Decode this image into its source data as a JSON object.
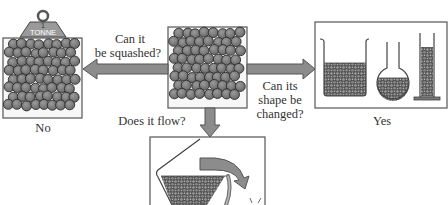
{
  "diagram": {
    "center_box": {
      "name": "solid-particles"
    },
    "left": {
      "question": [
        "Can it",
        "be squashed?"
      ],
      "weight_label_top": "1",
      "weight_label": "TONNE",
      "answer": "No"
    },
    "right": {
      "question": [
        "Can its",
        "shape be",
        "changed?"
      ],
      "answer": "Yes",
      "containers": [
        "beaker",
        "round-flask",
        "measuring-cylinder"
      ]
    },
    "bottom": {
      "question": "Does it flow?"
    },
    "colors": {
      "particle_fill": "#7a7a7a",
      "particle_stroke": "#2b2b2b",
      "arrow_fill": "#8c8c8c",
      "arrow_stroke": "#555555",
      "box_stroke": "#555555",
      "text": "#333333"
    }
  }
}
